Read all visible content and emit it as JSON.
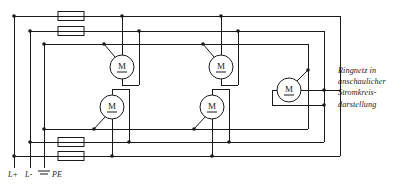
{
  "diagram": {
    "type": "electrical-circuit-schematic",
    "width": 405,
    "height": 186,
    "line_color": "#1a1a1a",
    "background_color": "#ffffff"
  },
  "caption": {
    "line1": "Ringnetz in",
    "line2": "anschaulicher",
    "line3": "Stromkreis-",
    "line4": "darstellung"
  },
  "rails": {
    "items": [
      {
        "id": "l-plus",
        "label": "L+",
        "x": 14
      },
      {
        "id": "l-minus",
        "label": "L-",
        "x": 30
      },
      {
        "id": "pe",
        "label": "PE",
        "x": 44
      }
    ],
    "earth_symbol": "earth-ground"
  },
  "motors": {
    "symbol_letter": "M",
    "items": [
      {
        "id": "motor-1",
        "label": "M",
        "cx": 122,
        "cy": 67,
        "r": 12
      },
      {
        "id": "motor-2",
        "label": "M",
        "cx": 221,
        "cy": 67,
        "r": 12
      },
      {
        "id": "motor-3",
        "label": "M",
        "cx": 289,
        "cy": 90,
        "r": 12
      },
      {
        "id": "motor-4",
        "label": "M",
        "cx": 112,
        "cy": 107,
        "r": 12
      },
      {
        "id": "motor-5",
        "label": "M",
        "cx": 212,
        "cy": 107,
        "r": 12
      }
    ]
  },
  "fuses": {
    "items": [
      {
        "id": "fuse-top-1",
        "x": 58,
        "y": 12,
        "w": 26,
        "h": 9
      },
      {
        "id": "fuse-top-2",
        "x": 58,
        "y": 27,
        "w": 26,
        "h": 9
      },
      {
        "id": "fuse-bottom-1",
        "x": 58,
        "y": 138,
        "w": 26,
        "h": 9
      },
      {
        "id": "fuse-bottom-2",
        "x": 58,
        "y": 152,
        "w": 26,
        "h": 9
      }
    ]
  },
  "buses": {
    "top": [
      {
        "id": "bus-top-l-plus",
        "y": 16
      },
      {
        "id": "bus-top-l-minus",
        "y": 31
      },
      {
        "id": "bus-top-pe",
        "y": 44
      }
    ],
    "bottom": [
      {
        "id": "bus-bottom-pe",
        "y": 129
      },
      {
        "id": "bus-bottom-l-minus",
        "y": 142
      },
      {
        "id": "bus-bottom-l-plus",
        "y": 156
      }
    ]
  },
  "ring_returns": {
    "items": [
      {
        "id": "ring-outer",
        "x": 340
      },
      {
        "id": "ring-middle",
        "x": 324
      },
      {
        "id": "ring-inner",
        "x": 308
      }
    ]
  }
}
